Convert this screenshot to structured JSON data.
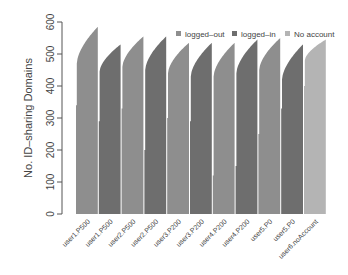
{
  "chart_data": {
    "type": "bar",
    "title": "",
    "xlabel": "",
    "ylabel": "No. ID–sharing Domains",
    "ylim": [
      0,
      600
    ],
    "yticks": [
      0,
      100,
      200,
      300,
      400,
      500,
      600
    ],
    "grid": false,
    "legend_position": "top-right",
    "legend": [
      {
        "name": "logged–out",
        "color": "#8e8e8e"
      },
      {
        "name": "logged–in",
        "color": "#6e6e6e"
      },
      {
        "name": "No account",
        "color": "#b4b4b4"
      }
    ],
    "categories": [
      "user1.P500",
      "user1.P500",
      "user2.P500",
      "user2.P500",
      "user3.P200",
      "user3.P200",
      "user4.P200",
      "user4.P200",
      "user5.P0",
      "user5.P0",
      "user6.noAccount"
    ],
    "groups": [
      {
        "label": "user1.P500",
        "state": "logged-out",
        "min": 340,
        "start": 470,
        "max": 585,
        "color": "#8e8e8e"
      },
      {
        "label": "user1.P500",
        "state": "logged-in",
        "min": 290,
        "start": 445,
        "max": 530,
        "color": "#6e6e6e"
      },
      {
        "label": "user2.P500",
        "state": "logged-out",
        "min": 330,
        "start": 460,
        "max": 555,
        "color": "#8e8e8e"
      },
      {
        "label": "user2.P500",
        "state": "logged-in",
        "min": 200,
        "start": 450,
        "max": 555,
        "color": "#6e6e6e"
      },
      {
        "label": "user3.P200",
        "state": "logged-out",
        "min": 300,
        "start": 440,
        "max": 535,
        "color": "#8e8e8e"
      },
      {
        "label": "user3.P200",
        "state": "logged-in",
        "min": 290,
        "start": 430,
        "max": 535,
        "color": "#6e6e6e"
      },
      {
        "label": "user4.P200",
        "state": "logged-out",
        "min": 120,
        "start": 430,
        "max": 535,
        "color": "#8e8e8e"
      },
      {
        "label": "user4.P200",
        "state": "logged-in",
        "min": 150,
        "start": 440,
        "max": 545,
        "color": "#6e6e6e"
      },
      {
        "label": "user5.P0",
        "state": "logged-out",
        "min": 250,
        "start": 450,
        "max": 550,
        "color": "#8e8e8e"
      },
      {
        "label": "user5.P0",
        "state": "logged-in",
        "min": 330,
        "start": 420,
        "max": 530,
        "color": "#6e6e6e"
      },
      {
        "label": "user6.noAccount",
        "state": "no-account",
        "min": 400,
        "start": 480,
        "max": 545,
        "color": "#b4b4b4"
      }
    ]
  }
}
